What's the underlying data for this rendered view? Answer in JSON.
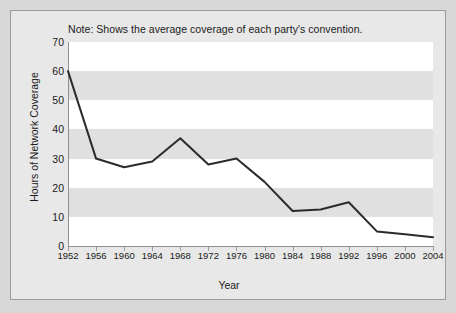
{
  "figure": {
    "note": "Note: Shows the average coverage of each party's convention.",
    "background_color": "#e8e8e8",
    "border_color": "#9a9a9a",
    "band_colors": [
      "#ffffff",
      "#e0e0e0"
    ]
  },
  "chart_data": {
    "type": "line",
    "title": "",
    "subtitle": "",
    "note": "Note: Shows the average coverage of each party's convention.",
    "xlabel": "Year",
    "ylabel": "Hours of Network Coverage",
    "categories": [
      "1952",
      "1956",
      "1960",
      "1964",
      "1968",
      "1972",
      "1976",
      "1980",
      "1984",
      "1988",
      "1992",
      "1996",
      "2000",
      "2004"
    ],
    "x": [
      1952,
      1956,
      1960,
      1964,
      1968,
      1972,
      1976,
      1980,
      1984,
      1988,
      1992,
      1996,
      2000,
      2004
    ],
    "values": [
      60,
      30,
      27,
      29,
      37,
      28,
      30,
      22,
      12,
      12.5,
      15,
      5,
      4,
      3
    ],
    "series": [
      {
        "name": "Hours of Network Coverage",
        "values": [
          60,
          30,
          27,
          29,
          37,
          28,
          30,
          22,
          12,
          12.5,
          15,
          5,
          4,
          3
        ],
        "color": "#2b2b2b",
        "line_width": 2
      }
    ],
    "ylim": [
      0,
      70
    ],
    "yticks": [
      0,
      10,
      20,
      30,
      40,
      50,
      60,
      70
    ],
    "ytick_labels": [
      "0",
      "10",
      "20",
      "30",
      "40",
      "50",
      "60",
      "70"
    ],
    "xlim": [
      1952,
      2004
    ],
    "grid": false,
    "banded_background": true,
    "legend": null,
    "legend_position": "none",
    "markers": false
  }
}
